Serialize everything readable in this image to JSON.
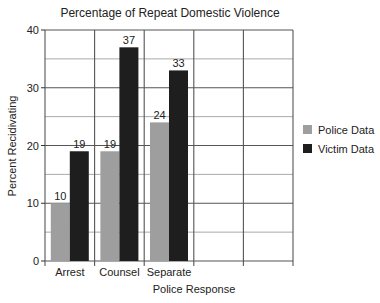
{
  "chart_data": {
    "type": "bar",
    "title": "Percentage of Repeat Domestic Violence",
    "xlabel": "Police Response",
    "ylabel": "Percent Recidivating",
    "categories": [
      "Arrest",
      "Counsel",
      "Separate"
    ],
    "empty_category_slots": 2,
    "series": [
      {
        "name": "Police Data",
        "values": [
          10,
          19,
          24
        ],
        "color": "#9e9e9e"
      },
      {
        "name": "Victim Data",
        "values": [
          19,
          37,
          33
        ],
        "color": "#1e1e1e"
      }
    ],
    "ylim": [
      0,
      40
    ],
    "yticks": [
      0,
      10,
      20,
      30,
      40
    ],
    "minor_grid_step": 5,
    "grid": true,
    "legend_position": "right"
  }
}
